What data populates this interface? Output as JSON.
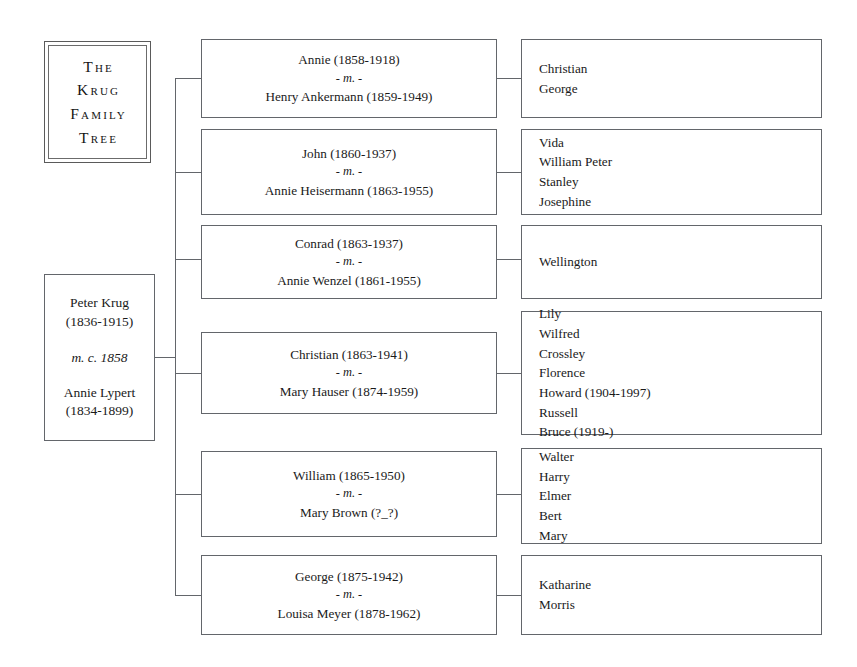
{
  "title": {
    "lines": [
      "The",
      "Krug",
      "Family",
      "Tree"
    ]
  },
  "root": {
    "person1": "Peter Krug",
    "person1_dates": "(1836-1915)",
    "marriage": "m. c. 1858",
    "person2": "Annie Lypert",
    "person2_dates": "(1834-1899)"
  },
  "marriage_symbol_prefix": "- ",
  "marriage_symbol": "m.",
  "marriage_symbol_suffix": " -",
  "families": [
    {
      "spouse1": "Annie (1858-1918)",
      "spouse2": "Henry Ankermann (1859-1949)",
      "children": [
        "Christian",
        "George"
      ]
    },
    {
      "spouse1": "John (1860-1937)",
      "spouse2": "Annie Heisermann (1863-1955)",
      "children": [
        "Vida",
        "William Peter",
        "Stanley",
        "Josephine"
      ]
    },
    {
      "spouse1": "Conrad (1863-1937)",
      "spouse2": "Annie Wenzel (1861-1955)",
      "children": [
        "Wellington"
      ]
    },
    {
      "spouse1": "Christian (1863-1941)",
      "spouse2": "Mary Hauser (1874-1959)",
      "children": [
        "Lily",
        "Wilfred",
        "Crossley",
        "Florence",
        "Howard (1904-1997)",
        "Russell",
        "Bruce (1919-)"
      ]
    },
    {
      "spouse1": "William (1865-1950)",
      "spouse2": "Mary Brown (?_?)",
      "children": [
        "Walter",
        "Harry",
        "Elmer",
        "Bert",
        "Mary"
      ]
    },
    {
      "spouse1": "George (1875-1942)",
      "spouse2": "Louisa Meyer (1878-1962)",
      "children": [
        "Katharine",
        "Morris"
      ]
    }
  ],
  "colors": {
    "line": "#63666b",
    "text": "#1a1a1a",
    "background": "#ffffff"
  }
}
